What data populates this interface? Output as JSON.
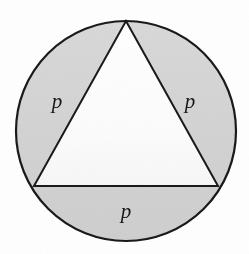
{
  "figure": {
    "canvas": {
      "width": 249,
      "height": 254,
      "background": "#ffffff"
    },
    "circle": {
      "name": "circumscribed-circle",
      "cx": 126,
      "cy": 131,
      "r": 110,
      "fill": "#d5d5d5",
      "stroke": "#1a1a1a",
      "stroke_width": 2.2
    },
    "triangle": {
      "name": "inscribed-equilateral-triangle",
      "points": "126,21 218,186 34,186",
      "vertices": [
        {
          "label": "apex",
          "x": 126,
          "y": 21
        },
        {
          "label": "bottom-right",
          "x": 218,
          "y": 186
        },
        {
          "label": "bottom-left",
          "x": 34,
          "y": 186
        }
      ],
      "fill": "#fdfdfd",
      "stroke": "#1a1a1a",
      "stroke_width": 2.0
    },
    "labels": [
      {
        "id": "left",
        "text": "p",
        "x": 57,
        "y": 108
      },
      {
        "id": "right",
        "text": "p",
        "x": 190,
        "y": 108
      },
      {
        "id": "bottom",
        "text": "p",
        "x": 126,
        "y": 218
      }
    ]
  }
}
